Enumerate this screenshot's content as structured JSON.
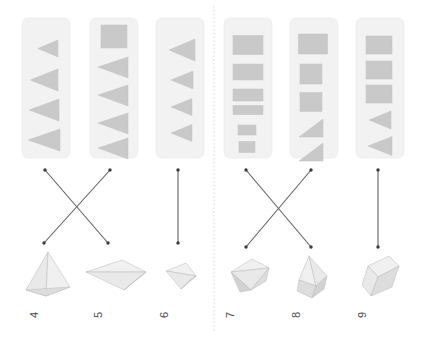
{
  "figure": {
    "canvas_width": 425,
    "canvas_height": 338,
    "background_color": "#ffffff",
    "orientation_note": "labels rotated 90 degrees",
    "divider": {
      "style": "dotted",
      "orientation": "vertical",
      "x": 214,
      "color": "#d8d8d8"
    }
  },
  "colors": {
    "panel_fill": "#f2f2f2",
    "glyph_fill": "#c9c9c9",
    "connector": "#5f5f66",
    "solid_light": "#e9e9e9",
    "solid_mid": "#dddddd",
    "solid_dark": "#d2d2d2"
  },
  "groups": [
    {
      "name": "left-group",
      "label": "left",
      "panel_ids": [
        "4",
        "5",
        "6"
      ]
    },
    {
      "name": "right-group",
      "label": "right",
      "panel_ids": [
        "7",
        "8",
        "9"
      ]
    }
  ],
  "panels": [
    {
      "id": "4",
      "label": "4",
      "x": 22,
      "y": 18,
      "w": 48,
      "h": 140,
      "glyph_summary": "four left-pointing triangles increasing in size",
      "glyph_count": 4,
      "glyphs": [
        {
          "shape": "triangle-left",
          "cx": 48,
          "cy": 48,
          "w": 20,
          "h": 17
        },
        {
          "shape": "triangle-left",
          "cx": 44,
          "cy": 80,
          "w": 28,
          "h": 22
        },
        {
          "shape": "triangle-left",
          "cx": 44,
          "cy": 110,
          "w": 30,
          "h": 22
        },
        {
          "shape": "triangle-left",
          "cx": 44,
          "cy": 140,
          "w": 32,
          "h": 22
        }
      ]
    },
    {
      "id": "5",
      "label": "5",
      "x": 90,
      "y": 18,
      "w": 48,
      "h": 140,
      "glyph_summary": "one square then four left-pointing triangles",
      "glyph_count": 5,
      "glyphs": [
        {
          "shape": "square",
          "cx": 114,
          "cy": 36,
          "w": 26,
          "h": 23
        },
        {
          "shape": "triangle-left",
          "cx": 113,
          "cy": 67,
          "w": 30,
          "h": 21
        },
        {
          "shape": "triangle-left",
          "cx": 113,
          "cy": 95,
          "w": 30,
          "h": 21
        },
        {
          "shape": "triangle-left",
          "cx": 113,
          "cy": 123,
          "w": 30,
          "h": 21
        },
        {
          "shape": "triangle-left",
          "cx": 113,
          "cy": 148,
          "w": 30,
          "h": 21
        }
      ]
    },
    {
      "id": "6",
      "label": "6",
      "x": 156,
      "y": 18,
      "w": 48,
      "h": 140,
      "glyph_summary": "four left-pointing triangles decreasing in size",
      "glyph_count": 4,
      "glyphs": [
        {
          "shape": "triangle-left",
          "cx": 182,
          "cy": 50,
          "w": 26,
          "h": 22
        },
        {
          "shape": "triangle-left",
          "cx": 182,
          "cy": 80,
          "w": 22,
          "h": 18
        },
        {
          "shape": "triangle-left",
          "cx": 182,
          "cy": 107,
          "w": 21,
          "h": 17
        },
        {
          "shape": "triangle-left",
          "cx": 182,
          "cy": 133,
          "w": 21,
          "h": 17
        }
      ]
    },
    {
      "id": "7",
      "label": "7",
      "x": 224,
      "y": 18,
      "w": 48,
      "h": 140,
      "glyph_summary": "six rectangles decreasing in size",
      "glyph_count": 6,
      "glyphs": [
        {
          "shape": "rect",
          "cx": 248,
          "cy": 45,
          "w": 30,
          "h": 19
        },
        {
          "shape": "rect",
          "cx": 248,
          "cy": 72,
          "w": 30,
          "h": 16
        },
        {
          "shape": "rect",
          "cx": 248,
          "cy": 95,
          "w": 30,
          "h": 12
        },
        {
          "shape": "rect",
          "cx": 248,
          "cy": 110,
          "w": 30,
          "h": 9
        },
        {
          "shape": "rect",
          "cx": 247,
          "cy": 130,
          "w": 18,
          "h": 10
        },
        {
          "shape": "rect",
          "cx": 247,
          "cy": 147,
          "w": 16,
          "h": 11
        }
      ]
    },
    {
      "id": "8",
      "label": "8",
      "x": 290,
      "y": 18,
      "w": 48,
      "h": 140,
      "glyph_summary": "three rectangles then two right triangles",
      "glyph_count": 5,
      "glyphs": [
        {
          "shape": "rect",
          "cx": 313,
          "cy": 44,
          "w": 29,
          "h": 20
        },
        {
          "shape": "rect",
          "cx": 311,
          "cy": 74,
          "w": 22,
          "h": 20
        },
        {
          "shape": "rect",
          "cx": 311,
          "cy": 102,
          "w": 22,
          "h": 19
        },
        {
          "shape": "triangle-corner",
          "cx": 311,
          "cy": 128,
          "w": 24,
          "h": 18
        },
        {
          "shape": "triangle-corner",
          "cx": 311,
          "cy": 152,
          "w": 24,
          "h": 18
        }
      ]
    },
    {
      "id": "9",
      "label": "9",
      "x": 356,
      "y": 18,
      "w": 48,
      "h": 140,
      "glyph_summary": "three rectangles then two left-pointing triangles",
      "glyph_count": 5,
      "glyphs": [
        {
          "shape": "rect",
          "cx": 379,
          "cy": 45,
          "w": 26,
          "h": 18
        },
        {
          "shape": "rect",
          "cx": 379,
          "cy": 70,
          "w": 26,
          "h": 18
        },
        {
          "shape": "rect",
          "cx": 379,
          "cy": 94,
          "w": 26,
          "h": 18
        },
        {
          "shape": "triangle-left",
          "cx": 380,
          "cy": 120,
          "w": 22,
          "h": 18
        },
        {
          "shape": "triangle-left",
          "cx": 380,
          "cy": 146,
          "w": 24,
          "h": 19
        }
      ]
    }
  ],
  "connectors": [
    {
      "id": "c-4-to-5",
      "from_panel": "4",
      "to_solid": "5",
      "x1": 45,
      "y1": 170,
      "x2": 108,
      "y2": 243
    },
    {
      "id": "c-5-to-4",
      "from_panel": "5",
      "to_solid": "4",
      "x1": 110,
      "y1": 170,
      "x2": 44,
      "y2": 243
    },
    {
      "id": "c-6-to-6",
      "from_panel": "6",
      "to_solid": "6",
      "x1": 178,
      "y1": 170,
      "x2": 178,
      "y2": 243
    },
    {
      "id": "c-7-to-8",
      "from_panel": "7",
      "to_solid": "8",
      "x1": 246,
      "y1": 170,
      "x2": 311,
      "y2": 247
    },
    {
      "id": "c-8-to-7",
      "from_panel": "8",
      "to_solid": "7",
      "x1": 311,
      "y1": 170,
      "x2": 246,
      "y2": 247
    },
    {
      "id": "c-9-to-9",
      "from_panel": "9",
      "to_solid": "9",
      "x1": 378,
      "y1": 170,
      "x2": 378,
      "y2": 247
    }
  ],
  "solids": [
    {
      "id": "4",
      "label": "4",
      "name": "tetrahedron-pyramid",
      "cx": 46,
      "cy": 275,
      "label_x": 28,
      "label_y": 318
    },
    {
      "id": "5",
      "label": "5",
      "name": "flat-kite-bipyramid",
      "cx": 114,
      "cy": 277,
      "label_x": 92,
      "label_y": 318
    },
    {
      "id": "6",
      "label": "6",
      "name": "small-kite-tetrahedron",
      "cx": 179,
      "cy": 275,
      "label_x": 158,
      "label_y": 318
    },
    {
      "id": "7",
      "label": "7",
      "name": "wedge-polyhedron",
      "cx": 247,
      "cy": 277,
      "label_x": 224,
      "label_y": 318
    },
    {
      "id": "8",
      "label": "8",
      "name": "house-pentahedron",
      "cx": 313,
      "cy": 277,
      "label_x": 290,
      "label_y": 318
    },
    {
      "id": "9",
      "label": "9",
      "name": "rectangular-prism-box",
      "cx": 380,
      "cy": 277,
      "label_x": 356,
      "label_y": 318
    }
  ]
}
